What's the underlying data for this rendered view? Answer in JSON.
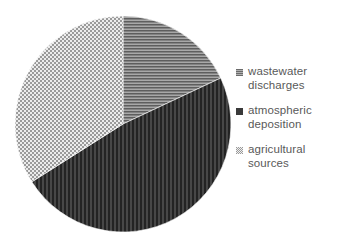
{
  "chart_data": {
    "type": "pie",
    "title": "",
    "subtitle": "",
    "xlabel": "",
    "ylabel": "",
    "grid": false,
    "legend_position": "right",
    "center": {
      "x": 123,
      "y": 124
    },
    "radius": 108,
    "start_angle_deg": 0,
    "direction": "clockwise",
    "categories": [
      "wastewater discharges",
      "atmospheric deposition",
      "agricultural sources"
    ],
    "values": [
      18,
      48,
      34
    ],
    "units": "percent",
    "slices": [
      {
        "label": "wastewater discharges",
        "label_line1": "wastewater",
        "label_line2": "discharges",
        "value": 18,
        "start_angle_deg": 0,
        "end_angle_deg": 64.8,
        "fill": "#8c8c8c",
        "pattern": "horizontal-lines",
        "pattern_line_color": "#4d4d4d",
        "pattern_bg_color": "#a6a6a6"
      },
      {
        "label": "atmospheric deposition",
        "label_line1": "atmospheric",
        "label_line2": "deposition",
        "value": 48,
        "start_angle_deg": 64.8,
        "end_angle_deg": 237.6,
        "fill": "#3a3a3a",
        "pattern": "vertical-lines",
        "pattern_line_color": "#1f1f1f",
        "pattern_bg_color": "#474747"
      },
      {
        "label": "agricultural sources",
        "label_line1": "agricultural",
        "label_line2": "sources",
        "value": 34,
        "start_angle_deg": 237.6,
        "end_angle_deg": 360,
        "fill": "#c9c9c9",
        "pattern": "checker-crosshatch",
        "pattern_line_color": "#8a8a8a",
        "pattern_bg_color": "#e8e8e8"
      }
    ]
  },
  "legend": {
    "items": [
      {
        "label": "wastewater\ndischarges",
        "swatch": "horizontal-lines-swatch"
      },
      {
        "label": "atmospheric\ndeposition",
        "swatch": "solid-dark-swatch"
      },
      {
        "label": "agricultural\nsources",
        "swatch": "checker-crosshatch-swatch"
      }
    ]
  },
  "colors": {
    "background": "#ffffff",
    "text": "#595959",
    "wastewater": "#8c8c8c",
    "atmospheric": "#3a3a3a",
    "agricultural": "#c9c9c9"
  }
}
